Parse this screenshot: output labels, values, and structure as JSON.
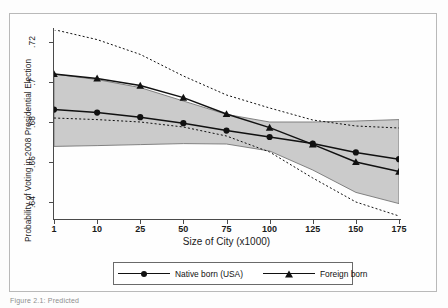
{
  "figure": {
    "caption_fragment": "Figure 2.1: Predicted"
  },
  "chart_data": {
    "type": "line",
    "title": "",
    "xlabel": "Size of City (x1000)",
    "ylabel": "Probability of Voting in 2008 Presidential Election",
    "x": [
      1,
      10,
      25,
      50,
      75,
      100,
      125,
      150,
      175
    ],
    "xtick_labels": [
      "1",
      "10",
      "25",
      "50",
      "75",
      "100",
      "125",
      "150",
      "175"
    ],
    "ytick_labels": [
      ".64",
      ".66",
      ".68",
      ".7",
      ".72"
    ],
    "ytick_values": [
      0.64,
      0.66,
      0.68,
      0.7,
      0.72
    ],
    "ylim": [
      0.632,
      0.726
    ],
    "grid": false,
    "legend_position": "below-axis",
    "series": [
      {
        "name": "Native born (USA)",
        "marker": "circle",
        "values": [
          0.6862,
          0.6847,
          0.6824,
          0.6794,
          0.6757,
          0.6725,
          0.6692,
          0.6648,
          0.6614
        ],
        "ci_type": "shaded-band",
        "ci_lower": [
          0.6678,
          0.6682,
          0.6687,
          0.6692,
          0.669,
          0.6655,
          0.656,
          0.6448,
          0.6392
        ],
        "ci_upper": [
          0.704,
          0.7012,
          0.6972,
          0.6905,
          0.6838,
          0.68,
          0.68,
          0.6805,
          0.6812
        ]
      },
      {
        "name": "Foreign born",
        "marker": "triangle",
        "values": [
          0.704,
          0.7018,
          0.6982,
          0.6922,
          0.684,
          0.6772,
          0.6688,
          0.66,
          0.6552
        ],
        "ci_type": "dotted-lines",
        "ci_lower": [
          0.682,
          0.6812,
          0.68,
          0.6775,
          0.673,
          0.665,
          0.652,
          0.64,
          0.633
        ],
        "ci_upper": [
          0.7262,
          0.7212,
          0.7138,
          0.703,
          0.6935,
          0.687,
          0.681,
          0.678,
          0.677
        ]
      }
    ],
    "colors": {
      "line": "#111111",
      "band_fill": "#c9c9c9",
      "band_edge": "#6f6f6f",
      "axis": "#4a4a4a"
    }
  },
  "legend": {
    "entries": [
      {
        "label": "Native born (USA)",
        "marker": "circle-marker"
      },
      {
        "label": "Foreign born",
        "marker": "triangle-marker"
      }
    ]
  }
}
